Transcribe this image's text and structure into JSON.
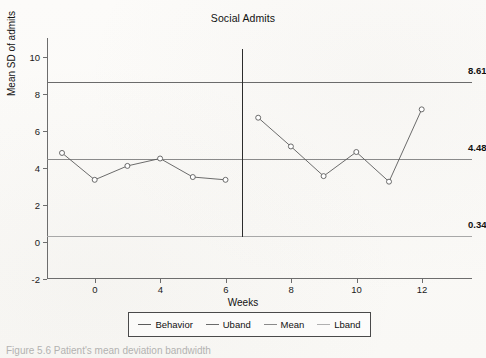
{
  "chart_data": {
    "type": "line",
    "title": "Social Admits",
    "xlabel": "Weeks",
    "ylabel": "Mean SD of admits",
    "xlim": [
      -2,
      13
    ],
    "ylim": [
      -2,
      11
    ],
    "xticks": [
      0,
      4,
      6,
      8,
      10,
      12
    ],
    "xtick_labels": [
      "0",
      "4",
      "6",
      "8",
      "10",
      "12"
    ],
    "yticks": [
      -2,
      0,
      2,
      4,
      6,
      8,
      10
    ],
    "ytick_labels": [
      "-2",
      "0",
      "2",
      "4",
      "6",
      "8",
      "10"
    ],
    "grid": false,
    "legend_position": "bottom",
    "phase_divider_x": 6.35,
    "series": [
      {
        "name": "Behavior",
        "color": "#5b5b5b",
        "marker": "circle-open",
        "x": [
          -1,
          0,
          1,
          2,
          3,
          4,
          5,
          6,
          7,
          8,
          9,
          10
        ],
        "values": [
          4.8,
          3.35,
          4.1,
          4.5,
          3.5,
          3.35,
          6.7,
          5.15,
          3.55,
          4.85,
          3.25,
          7.15
        ],
        "phase_a_points": 6,
        "phase_b_points": 6
      }
    ],
    "reference_lines": [
      {
        "name": "Uband",
        "value": 8.61,
        "label": "8.61",
        "color": "#6b6b6b"
      },
      {
        "name": "Mean",
        "value": 4.48,
        "label": "4.48",
        "color": "#8a8a8a"
      },
      {
        "name": "Lband",
        "value": 0.34,
        "label": "0.34",
        "color": "#a8a8a8"
      }
    ]
  },
  "legend": {
    "items": [
      {
        "label": "Behavior",
        "color": "#5b5b5b"
      },
      {
        "label": "Uband",
        "color": "#6b6b6b"
      },
      {
        "label": "Mean",
        "color": "#8a8a8a"
      },
      {
        "label": "Lband",
        "color": "#b0b0b0"
      }
    ]
  },
  "caption": "Figure 5.6  Patient's mean deviation bandwidth"
}
